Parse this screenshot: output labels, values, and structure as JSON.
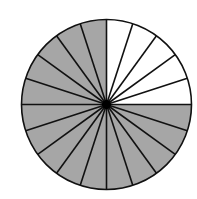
{
  "diagram": {
    "type": "fraction-circle",
    "total_segments": 20,
    "shaded_segments": 15,
    "unshaded_segments": 5,
    "segment_angle_deg": 18,
    "unshaded_region": "top-right quadrant",
    "shaded_fraction": "15/20",
    "colors": {
      "shaded": "#a6a6a6",
      "unshaded": "#ffffff",
      "stroke": "#111111",
      "center_dot": "#000000"
    },
    "geometry": {
      "cx": 106.5,
      "cy": 104.5,
      "r": 85
    }
  }
}
